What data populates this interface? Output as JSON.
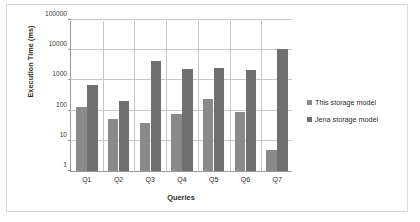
{
  "chart_data": {
    "type": "bar",
    "title": "",
    "xlabel": "Queries",
    "ylabel": "Execution Time (ms)",
    "yscale": "log",
    "ylim": [
      1,
      100000
    ],
    "ytick_labels": [
      "100000",
      "10000",
      "1000",
      "100",
      "10",
      "1"
    ],
    "ytick_values": [
      100000,
      10000,
      1000,
      100,
      10,
      1
    ],
    "grid": true,
    "legend_position": "right",
    "categories": [
      "Q1",
      "Q2",
      "Q3",
      "Q4",
      "Q5",
      "Q6",
      "Q7"
    ],
    "series": [
      {
        "name": "This storage model",
        "color": "#8a8a8a",
        "values": [
          135,
          52,
          38,
          80,
          235,
          90,
          5
        ]
      },
      {
        "name": "Jena storage model",
        "color": "#6f6f6f",
        "values": [
          680,
          205,
          4400,
          2400,
          2550,
          2150,
          11000
        ]
      }
    ]
  },
  "axes": {
    "y_title": "Execution Time (ms)",
    "x_title": "Queries"
  },
  "legend": {
    "items": [
      {
        "label": "This storage model",
        "color": "#8a8a8a"
      },
      {
        "label": "Jena storage model",
        "color": "#6f6f6f"
      }
    ]
  },
  "colors": {
    "series_1": "#8a8a8a",
    "series_2": "#6f6f6f",
    "gridline": "#c6c6c6",
    "axis": "#9a9a9a",
    "frame": "#d9d9d9"
  }
}
